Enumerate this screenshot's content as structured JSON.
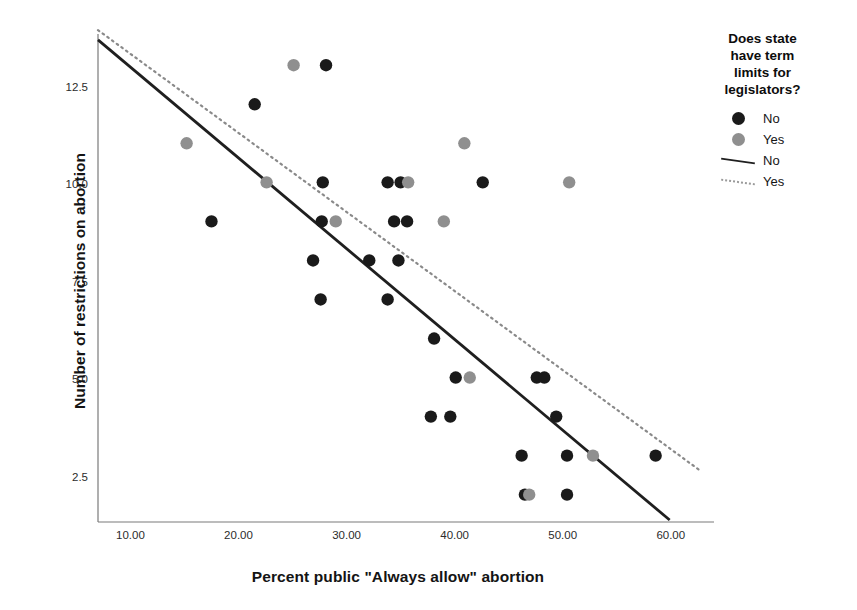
{
  "chart_data": {
    "type": "scatter",
    "title": "",
    "xlabel": "Percent public \"Always allow\" abortion",
    "ylabel": "Number of restrictions on abortion",
    "xlim": [
      7.0,
      64.0
    ],
    "ylim": [
      1.4,
      13.9
    ],
    "xticks": [
      "10.00",
      "20.00",
      "30.00",
      "40.00",
      "50.00",
      "60.00"
    ],
    "xtick_values": [
      10,
      20,
      30,
      40,
      50,
      60
    ],
    "yticks": [
      "2.5",
      "5.0",
      "7.5",
      "10.0",
      "12.5"
    ],
    "ytick_values": [
      2.5,
      5.0,
      7.5,
      10.0,
      12.5
    ],
    "grid": false,
    "legend_position": "right",
    "legend": {
      "title": "Does state have term limits for legislators?",
      "title_lines": [
        "Does state",
        "have term",
        "limits for",
        "legislators?"
      ],
      "entries": [
        {
          "label": "No",
          "kind": "marker",
          "color": "#1a1a1a"
        },
        {
          "label": "Yes",
          "kind": "marker",
          "color": "#8f8f8f"
        },
        {
          "label": "No",
          "kind": "line",
          "style": "solid",
          "color": "#1f1f1f"
        },
        {
          "label": "Yes",
          "kind": "line",
          "style": "dotted",
          "color": "#9a9a9a"
        }
      ]
    },
    "series": [
      {
        "name": "No",
        "marker_color": "#1a1a1a",
        "points": [
          [
            28.1,
            13.1
          ],
          [
            21.5,
            12.1
          ],
          [
            27.8,
            10.1
          ],
          [
            33.8,
            10.1
          ],
          [
            35.0,
            10.1
          ],
          [
            42.6,
            10.1
          ],
          [
            17.5,
            9.1
          ],
          [
            27.7,
            9.1
          ],
          [
            34.4,
            9.1
          ],
          [
            35.6,
            9.1
          ],
          [
            26.9,
            8.1
          ],
          [
            32.1,
            8.1
          ],
          [
            34.8,
            8.1
          ],
          [
            27.6,
            7.1
          ],
          [
            33.8,
            7.1
          ],
          [
            38.1,
            6.1
          ],
          [
            40.1,
            5.1
          ],
          [
            47.6,
            5.1
          ],
          [
            48.3,
            5.1
          ],
          [
            49.4,
            4.1
          ],
          [
            37.8,
            4.1
          ],
          [
            39.6,
            4.1
          ],
          [
            46.2,
            3.1
          ],
          [
            50.4,
            3.1
          ],
          [
            58.6,
            3.1
          ],
          [
            46.5,
            2.1
          ],
          [
            50.4,
            2.1
          ]
        ]
      },
      {
        "name": "Yes",
        "marker_color": "#8f8f8f",
        "points": [
          [
            25.1,
            13.1
          ],
          [
            15.2,
            11.1
          ],
          [
            40.9,
            11.1
          ],
          [
            22.6,
            10.1
          ],
          [
            35.7,
            10.1
          ],
          [
            50.6,
            10.1
          ],
          [
            29.0,
            9.1
          ],
          [
            39.0,
            9.1
          ],
          [
            41.4,
            5.1
          ],
          [
            52.8,
            3.1
          ],
          [
            46.9,
            2.1
          ]
        ]
      }
    ],
    "fit_lines": [
      {
        "name": "No",
        "style": "solid",
        "color": "#1f1f1f",
        "x_start": 7.0,
        "y_start": 13.75,
        "x_end": 59.9,
        "y_end": 1.45
      },
      {
        "name": "Yes",
        "style": "dotted",
        "color": "#8a8a8a",
        "x_start": 7.0,
        "y_start": 14.0,
        "x_end": 62.8,
        "y_end": 2.7
      }
    ]
  }
}
